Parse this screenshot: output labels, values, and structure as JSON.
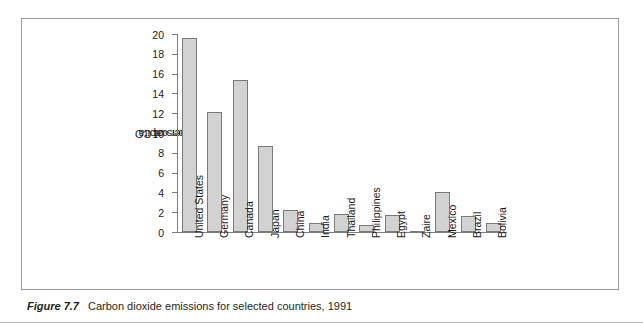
{
  "figure": {
    "caption_number": "Figure 7.7",
    "caption_text": "Carbon dioxide emissions for selected countries, 1991"
  },
  "colors": {
    "bar_fill": "#d2d2d2",
    "bar_stroke": "#7a7a7a",
    "axis": "#7d7d7d",
    "frame": "#9a9a9a",
    "text": "#1a1a1a"
  },
  "chart_data": {
    "type": "bar",
    "title": "",
    "xlabel": "",
    "ylabel": "Tons of CO2 per capita",
    "ylabel_parts": {
      "pre": "Tons of CO",
      "sub": "2",
      "post": " per capita"
    },
    "ylim": [
      0,
      20
    ],
    "yticks": [
      0,
      2,
      4,
      6,
      8,
      10,
      12,
      14,
      16,
      18,
      20
    ],
    "ytick_labels": [
      "0",
      "2",
      "4",
      "6",
      "8",
      "10",
      "12",
      "14",
      "16",
      "18",
      "20"
    ],
    "grid": false,
    "legend": "none",
    "categories": [
      "United States",
      "Germany",
      "Canada",
      "Japan",
      "China",
      "India",
      "Thailand",
      "Philippines",
      "Egypt",
      "Zaire",
      "Mexico",
      "Brazil",
      "Bolivia"
    ],
    "values": [
      19.6,
      12.1,
      15.4,
      8.7,
      2.2,
      0.9,
      1.8,
      0.7,
      1.7,
      0.1,
      4.0,
      1.6,
      0.9
    ]
  }
}
